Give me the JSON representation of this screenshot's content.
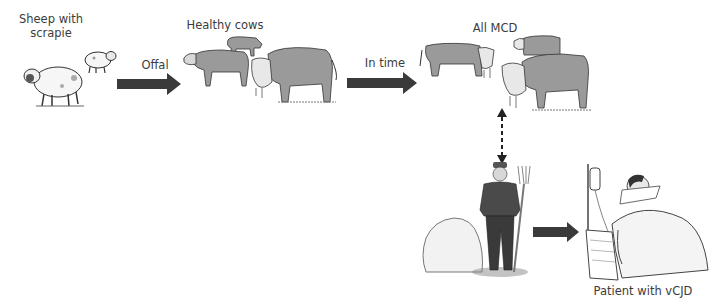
{
  "diagram": {
    "labels": {
      "sheep": "Sheep with\nscrapie",
      "sheep_line1": "Sheep with",
      "sheep_line2": "scrapie",
      "offal": "Offal",
      "healthy_cows": "Healthy cows",
      "cow_mcd_line1": "Cow with",
      "cow_mcd_line2": "MCD",
      "in_time": "In time",
      "all_mcd": "All MCD",
      "patient": "Patient with vCJD"
    },
    "nodes": [
      {
        "id": "sheep",
        "label": "Sheep with scrapie",
        "icon": "sheep-icon"
      },
      {
        "id": "healthy-cows",
        "label": "Healthy cows",
        "icon": "cow-icon"
      },
      {
        "id": "cow-mcd",
        "label": "Cow with MCD",
        "icon": "cow-icon"
      },
      {
        "id": "all-mcd",
        "label": "All MCD",
        "icon": "cow-herd-icon"
      },
      {
        "id": "farmer",
        "label": "",
        "icon": "farmer-icon"
      },
      {
        "id": "patient",
        "label": "Patient with vCJD",
        "icon": "hospital-bed-icon"
      }
    ],
    "edges": [
      {
        "from": "sheep",
        "to": "healthy-cows",
        "label": "Offal",
        "style": "solid-arrow"
      },
      {
        "from": "cow-mcd",
        "to": "all-mcd",
        "label": "In time",
        "style": "solid-arrow"
      },
      {
        "from": "all-mcd",
        "to": "farmer",
        "label": "",
        "style": "dashed-double-arrow"
      },
      {
        "from": "farmer",
        "to": "patient",
        "label": "",
        "style": "solid-arrow"
      }
    ],
    "colors": {
      "arrow": "#3a3a3a",
      "cow_fill": "#9a9a9a",
      "sheep_fill": "#f4f4f4",
      "text": "#3c3c3c"
    }
  }
}
